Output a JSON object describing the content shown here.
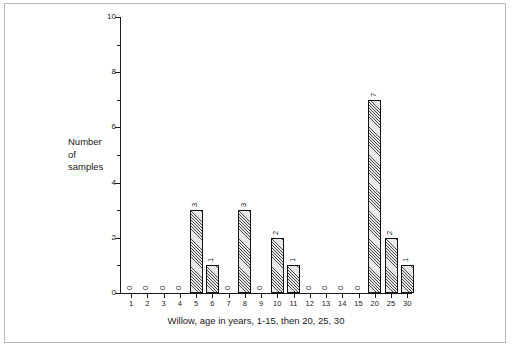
{
  "figure": {
    "background_color": "#ffffff",
    "frame_color": "#b9b9b9",
    "axis_color": "#1a1a1a",
    "bar_fill_color": "#e8e8e8",
    "bar_hatch_color": "#4a4a4a",
    "bar_edge_color": "#111111"
  },
  "y_axis": {
    "title_line1": "Number",
    "title_line2": "of",
    "title_line3": "samples",
    "tick_labels": [
      "0",
      "2",
      "4",
      "6",
      "8",
      "10"
    ],
    "minor_tick_values": [
      1,
      3,
      5,
      7,
      9
    ]
  },
  "x_axis": {
    "caption": "Willow, age in years, 1-15, then 20, 25, 30",
    "tick_labels": [
      "1",
      "2",
      "3",
      "4",
      "5",
      "6",
      "7",
      "8",
      "9",
      "10",
      "11",
      "12",
      "13",
      "14",
      "15",
      "20",
      "25",
      "30"
    ]
  },
  "chart_data": {
    "type": "bar",
    "title": "",
    "subtitle": "",
    "xlabel": "Willow, age in years, 1-15, then 20, 25, 30",
    "ylabel": "Number of samples",
    "categories": [
      "1",
      "2",
      "3",
      "4",
      "5",
      "6",
      "7",
      "8",
      "9",
      "10",
      "11",
      "12",
      "13",
      "14",
      "15",
      "20",
      "25",
      "30"
    ],
    "values": [
      0,
      0,
      0,
      0,
      3,
      1,
      0,
      3,
      0,
      2,
      1,
      0,
      0,
      0,
      0,
      7,
      2,
      1
    ],
    "bar_labels": [
      "0",
      "0",
      "0",
      "0",
      "3",
      "1",
      "0",
      "3",
      "0",
      "2",
      "1",
      "0",
      "0",
      "0",
      "0",
      "7",
      "2",
      "1"
    ],
    "bar_label_rotation": 90,
    "ylim": [
      0,
      10
    ],
    "yticks": [
      0,
      2,
      4,
      6,
      8,
      10
    ],
    "grid": false,
    "legend": false,
    "legend_position": "none"
  }
}
